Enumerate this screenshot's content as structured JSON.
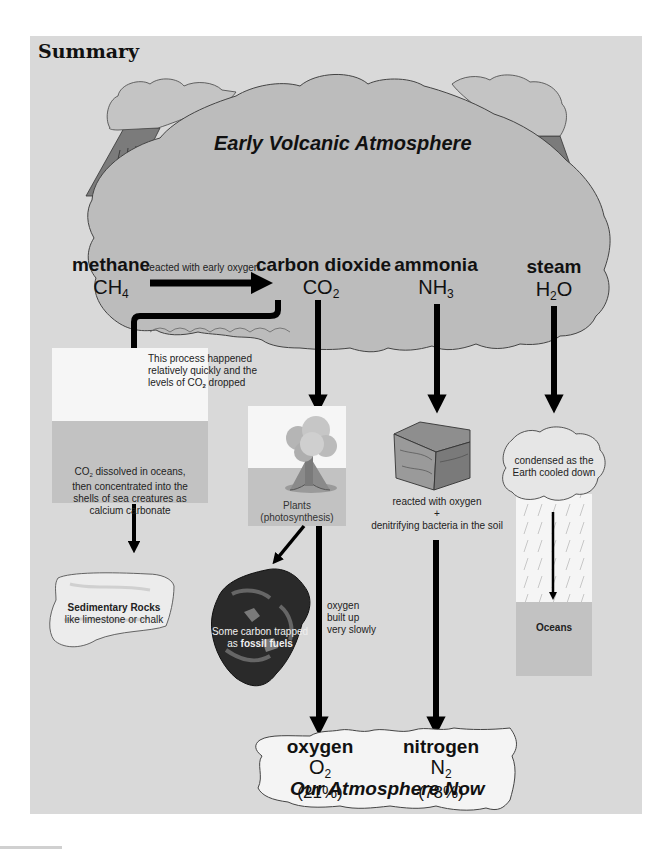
{
  "title": "Summary",
  "early_atmosphere": {
    "heading": "Early Volcanic Atmosphere",
    "gases": [
      {
        "name": "methane",
        "formula_main": "CH",
        "formula_sub": "4",
        "formula_after": ""
      },
      {
        "name": "carbon dioxide",
        "formula_main": "CO",
        "formula_sub": "2",
        "formula_after": ""
      },
      {
        "name": "ammonia",
        "formula_main": "NH",
        "formula_sub": "3",
        "formula_after": ""
      },
      {
        "name": "steam",
        "formula_main": "H",
        "formula_sub": "2",
        "formula_after": "O"
      }
    ],
    "methane_arrow_label": "reacted with early oxygen"
  },
  "co2_ocean_path": {
    "process_note_line1": "This process happened",
    "process_note_line2": "relatively quickly and the",
    "process_note_line3_pre": "levels of CO",
    "process_note_line3_sub": "2",
    "process_note_line3_post": " dropped",
    "ocean_text_line1_pre": "CO",
    "ocean_text_line1_sub": "2",
    "ocean_text_line1_post": " dissolved in oceans,",
    "ocean_text_line2": "then concentrated into the",
    "ocean_text_line3": "shells of sea creatures as",
    "ocean_text_line4": "calcium carbonate",
    "rocks_title": "Sedimentary Rocks",
    "rocks_sub": "like limestone or chalk"
  },
  "plants_path": {
    "plants_label": "Plants",
    "plants_sub": "(photosynthesis)",
    "fossil_line1": "Some carbon trapped",
    "fossil_line2_pre": "as ",
    "fossil_line2_bold": "fossil fuels",
    "oxygen_note_line1": "oxygen",
    "oxygen_note_line2": "built up",
    "oxygen_note_line3": "very slowly"
  },
  "ammonia_path": {
    "note_line1": "reacted with oxygen",
    "note_line2": "+",
    "note_line3": "denitrifying bacteria in the soil"
  },
  "steam_path": {
    "cloud_line1": "condensed as the",
    "cloud_line2": "Earth cooled down",
    "oceans_label": "Oceans"
  },
  "atmosphere_now": {
    "heading": "Our Atmosphere Now",
    "gases": [
      {
        "name": "oxygen",
        "formula_main": "O",
        "formula_sub": "2",
        "percent": "(21%)"
      },
      {
        "name": "nitrogen",
        "formula_main": "N",
        "formula_sub": "2",
        "percent": "(78%)"
      }
    ]
  },
  "colors": {
    "background_panel": "#d9d9d9",
    "cloud_fill": "#bdbdbd",
    "volcano": "#7a7a7a",
    "arrow": "#000000",
    "sea": "#c4c4c4",
    "sky": "#f7f7f7"
  }
}
